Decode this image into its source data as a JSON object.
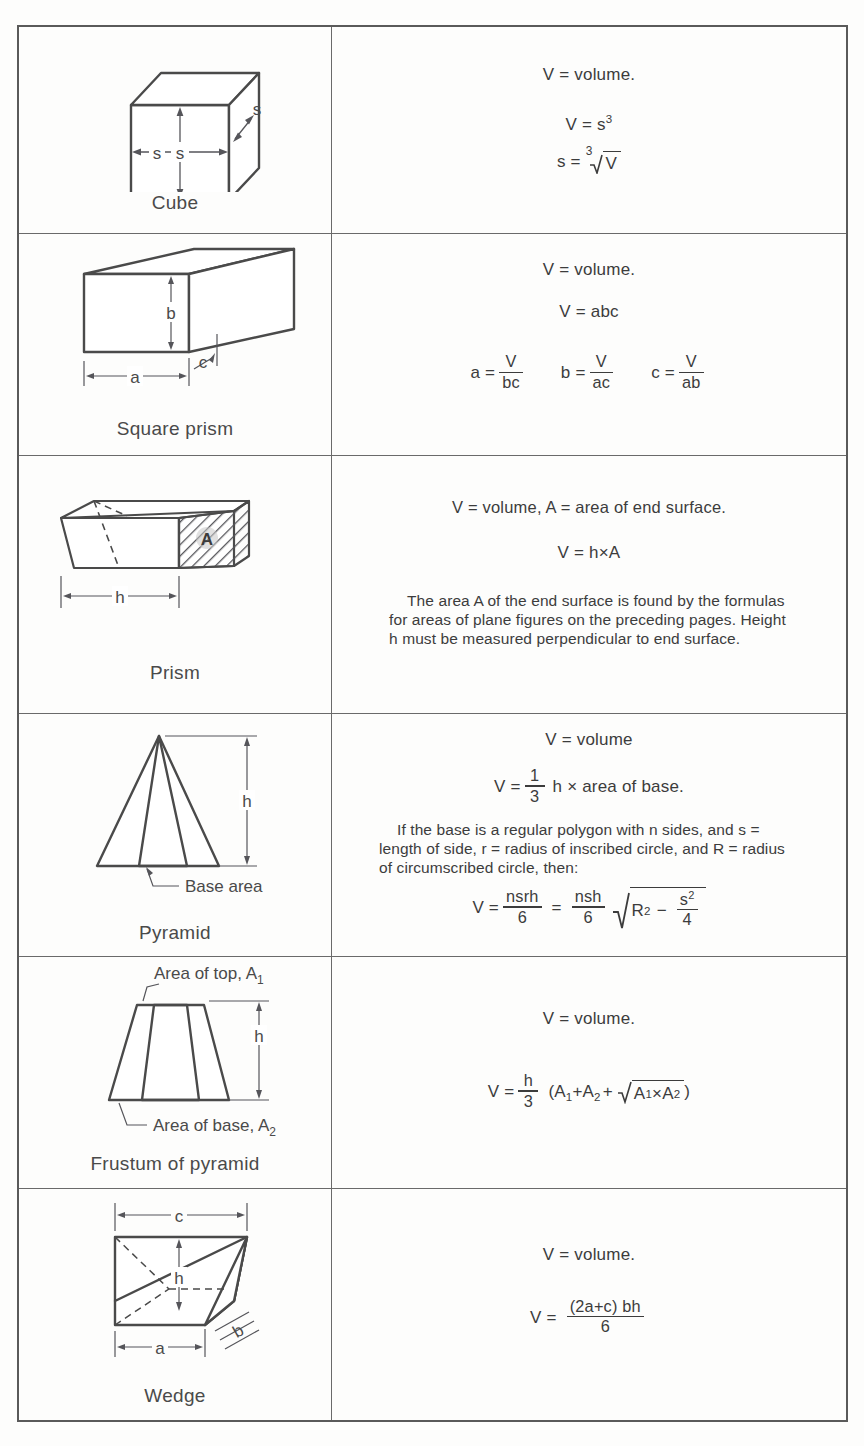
{
  "document": {
    "title": "Volumes of solid bodies",
    "column_headers": [
      "Figure",
      "Formula"
    ]
  },
  "rows": [
    {
      "id": "cube",
      "figure": {
        "name": "Cube",
        "labels": [
          "s",
          "s",
          "s"
        ],
        "icon": "cube-diagram"
      },
      "formulas": {
        "line1": "V  =  volume.",
        "line2_lhs": "V  =  s",
        "line2_exp": "3",
        "line3_lhs": "s  =",
        "line3_root_index": "3",
        "line3_radicand": "V"
      }
    },
    {
      "id": "square-prism",
      "figure": {
        "name": "Square prism",
        "labels": [
          "a",
          "b",
          "c"
        ],
        "icon": "rectangular-box-diagram"
      },
      "formulas": {
        "line1": "V  =  volume.",
        "line2": "V  =  abc",
        "solved": [
          {
            "lhs": "a  =",
            "num": "V",
            "den": "bc"
          },
          {
            "lhs": "b  =",
            "num": "V",
            "den": "ac"
          },
          {
            "lhs": "c  =",
            "num": "V",
            "den": "ab"
          }
        ]
      }
    },
    {
      "id": "prism",
      "figure": {
        "name": "Prism",
        "labels": [
          "A",
          "h"
        ],
        "icon": "prism-diagram"
      },
      "formulas": {
        "line1": "V  =  volume,   A  =  area of end surface.",
        "line2": "V  =  h×A",
        "paragraph": "The area A of the end surface is found by the formulas for areas of plane figures on the preceding pages.  Height h must be measured perpendicular to end surface."
      }
    },
    {
      "id": "pyramid",
      "figure": {
        "name": "Pyramid",
        "labels": [
          "h",
          "Base area"
        ],
        "icon": "pyramid-diagram"
      },
      "formulas": {
        "line1": "V  =  volume",
        "line2_lhs": "V  =",
        "line2_num": "1",
        "line2_den": "3",
        "line2_rhs": "h × area of base.",
        "paragraph": "If the base is a regular polygon with n sides, and s = length of side, r = radius of inscribed circle, and R = radius of circumscribed circle, then:",
        "line4_lhs": "V  =",
        "line4_num1": "nsrh",
        "line4_den1": "6",
        "line4_mid": "=",
        "line4_num2": "nsh",
        "line4_den2": "6",
        "line4_rad_base": "R",
        "line4_rad_exp": "2",
        "line4_rad_minus": "−",
        "line4_rad_num": "s",
        "line4_rad_num_exp": "2",
        "line4_rad_den": "4"
      }
    },
    {
      "id": "frustum-of-pyramid",
      "figure": {
        "name": "Frustum of pyramid",
        "label_top": "Area of top, A",
        "label_top_sub": "1",
        "label_base": "Area of base, A",
        "label_base_sub": "2",
        "label_height": "h",
        "icon": "frustum-diagram"
      },
      "formulas": {
        "line1": "V  =  volume.",
        "line2_lhs": "V  =",
        "line2_num": "h",
        "line2_den": "3",
        "line2_open": "(A",
        "line2_sub1": "1",
        "line2_plus1": "+A",
        "line2_sub2": "2",
        "line2_plus2": "+",
        "line2_rad_a": "A",
        "line2_rad_a_sub": "1",
        "line2_rad_times": "×A",
        "line2_rad_b_sub": "2",
        "line2_close": ")"
      }
    },
    {
      "id": "wedge",
      "figure": {
        "name": "Wedge",
        "labels": [
          "a",
          "b",
          "c",
          "h"
        ],
        "icon": "wedge-diagram"
      },
      "formulas": {
        "line1": "V  =  volume.",
        "line2_lhs": "V  =",
        "line2_num": "(2a+c) bh",
        "line2_den": "6"
      }
    }
  ],
  "colors": {
    "ink": "#3c3c3c",
    "rule": "#6a6a6a",
    "paper": "#fdfdfc"
  }
}
